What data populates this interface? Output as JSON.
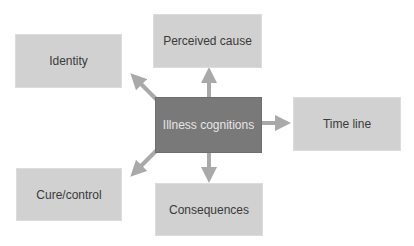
{
  "diagram": {
    "title": "Illness cognitions",
    "center": {
      "label": "Illness cognitions"
    },
    "nodes": [
      {
        "id": "identity",
        "label": "Identity"
      },
      {
        "id": "perceived-cause",
        "label": "Perceived cause"
      },
      {
        "id": "time-line",
        "label": "Time line"
      },
      {
        "id": "cure-control",
        "label": "Cure/control"
      },
      {
        "id": "consequences",
        "label": "Consequences"
      }
    ],
    "edges": [
      {
        "from": "Illness cognitions",
        "to": "Identity"
      },
      {
        "from": "Illness cognitions",
        "to": "Perceived cause"
      },
      {
        "from": "Illness cognitions",
        "to": "Time line"
      },
      {
        "from": "Illness cognitions",
        "to": "Cure/control"
      },
      {
        "from": "Illness cognitions",
        "to": "Consequences"
      }
    ],
    "colors": {
      "center_fill": "#797979",
      "center_text": "#e6e6e6",
      "node_fill": "#d1d1d1",
      "node_text": "#3a3a3a",
      "arrow": "#a9a9a9"
    }
  }
}
